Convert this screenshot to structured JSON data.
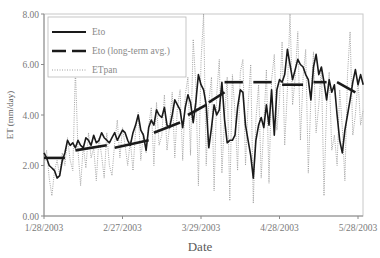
{
  "chart_data": {
    "type": "line",
    "title": "",
    "xlabel": "Date",
    "ylabel": "ET (mm/day)",
    "ylim": [
      0,
      8
    ],
    "yticks": [
      "0.00",
      "2.00",
      "4.00",
      "6.00",
      "8.00"
    ],
    "xticks": [
      "1/28/2003",
      "2/27/2003",
      "3/29/2003",
      "4/28/2003",
      "5/28/2003"
    ],
    "xtick_days": [
      0,
      30,
      60,
      90,
      120
    ],
    "grid": false,
    "legend_position": "upper left",
    "legend": [
      "Eto",
      "Eto (long-term avg.)",
      "ETpan"
    ],
    "x_unit": "days since 1/28/2003",
    "series": [
      {
        "name": "Eto",
        "style": "solid",
        "x": [
          0,
          1,
          2,
          3,
          4,
          5,
          6,
          7,
          8,
          9,
          10,
          11,
          12,
          13,
          14,
          15,
          16,
          17,
          18,
          19,
          20,
          21,
          22,
          23,
          24,
          25,
          26,
          27,
          28,
          29,
          30,
          31,
          32,
          33,
          34,
          35,
          36,
          37,
          38,
          39,
          40,
          41,
          42,
          43,
          44,
          45,
          46,
          47,
          48,
          49,
          50,
          51,
          52,
          53,
          54,
          55,
          56,
          57,
          58,
          59,
          60,
          61,
          62,
          63,
          64,
          65,
          66,
          67,
          68,
          69,
          70,
          71,
          72,
          73,
          74,
          75,
          76,
          77,
          78,
          79,
          80,
          81,
          82,
          83,
          84,
          85,
          86,
          87,
          88,
          89,
          90,
          91,
          92,
          93,
          94,
          95,
          96,
          97,
          98,
          99,
          100,
          101,
          102,
          103,
          104,
          105,
          106,
          107,
          108,
          109,
          110,
          111,
          112,
          113,
          114,
          115,
          116,
          117,
          118,
          119,
          120,
          121,
          122
        ],
        "values": [
          2.5,
          2.3,
          2.0,
          1.9,
          1.8,
          1.5,
          1.6,
          2.2,
          2.5,
          3.0,
          2.8,
          2.9,
          2.7,
          3.0,
          2.8,
          2.7,
          3.1,
          3.0,
          2.8,
          3.2,
          2.9,
          3.0,
          3.3,
          3.1,
          3.0,
          2.9,
          3.1,
          3.3,
          3.0,
          3.2,
          3.4,
          3.3,
          3.0,
          2.8,
          3.3,
          3.6,
          4.0,
          3.4,
          3.2,
          2.6,
          3.5,
          3.8,
          3.6,
          4.2,
          4.0,
          3.9,
          4.3,
          3.6,
          3.5,
          4.0,
          4.6,
          4.4,
          4.2,
          3.5,
          4.3,
          4.8,
          4.5,
          3.7,
          4.5,
          5.6,
          5.2,
          5.0,
          4.4,
          2.7,
          3.5,
          4.4,
          4.0,
          4.2,
          5.3,
          3.8,
          2.9,
          3.0,
          3.0,
          3.2,
          4.3,
          5.0,
          4.9,
          3.6,
          3.0,
          2.4,
          1.5,
          3.0,
          3.6,
          3.9,
          3.5,
          4.4,
          3.6,
          5.0,
          3.2,
          5.0,
          5.4,
          5.3,
          5.6,
          6.6,
          6.0,
          5.4,
          5.8,
          6.2,
          6.0,
          5.9,
          5.6,
          5.4,
          4.6,
          5.9,
          6.4,
          5.6,
          5.9,
          5.3,
          4.6,
          5.4,
          4.9,
          5.2,
          4.0,
          3.0,
          2.5,
          3.4,
          4.0,
          4.6,
          5.3,
          5.8,
          5.2,
          5.6,
          5.2
        ],
        "color": "#1a1a1a"
      },
      {
        "name": "Eto (long-term avg.)",
        "style": "dashed",
        "segments": [
          {
            "x0": 0,
            "x1": 8,
            "y0": 2.3,
            "y1": 2.3
          },
          {
            "x0": 12,
            "x1": 24,
            "y0": 2.6,
            "y1": 2.8
          },
          {
            "x0": 27,
            "x1": 40,
            "y0": 2.7,
            "y1": 3.0
          },
          {
            "x0": 42,
            "x1": 52,
            "y0": 3.3,
            "y1": 3.7
          },
          {
            "x0": 55,
            "x1": 62,
            "y0": 4.0,
            "y1": 4.4
          },
          {
            "x0": 63,
            "x1": 69,
            "y0": 4.5,
            "y1": 4.9
          },
          {
            "x0": 69,
            "x1": 76,
            "y0": 5.3,
            "y1": 5.3
          },
          {
            "x0": 80,
            "x1": 87,
            "y0": 5.3,
            "y1": 5.3
          },
          {
            "x0": 91,
            "x1": 99,
            "y0": 5.2,
            "y1": 5.2
          },
          {
            "x0": 103,
            "x1": 108,
            "y0": 5.3,
            "y1": 5.3
          },
          {
            "x0": 112,
            "x1": 119,
            "y0": 5.3,
            "y1": 4.9
          }
        ],
        "color": "#1a1a1a"
      },
      {
        "name": "ETpan",
        "style": "dotted",
        "x": [
          0,
          1,
          2,
          3,
          4,
          5,
          6,
          7,
          8,
          9,
          10,
          11,
          12,
          13,
          14,
          15,
          16,
          17,
          18,
          19,
          20,
          21,
          22,
          23,
          24,
          25,
          26,
          27,
          28,
          29,
          30,
          31,
          32,
          33,
          34,
          35,
          36,
          37,
          38,
          39,
          40,
          41,
          42,
          43,
          44,
          45,
          46,
          47,
          48,
          49,
          50,
          51,
          52,
          53,
          54,
          55,
          56,
          57,
          58,
          59,
          60,
          61,
          62,
          63,
          64,
          65,
          66,
          67,
          68,
          69,
          70,
          71,
          72,
          73,
          74,
          75,
          76,
          77,
          78,
          79,
          80,
          81,
          82,
          83,
          84,
          85,
          86,
          87,
          88,
          89,
          90,
          91,
          92,
          93,
          94,
          95,
          96,
          97,
          98,
          99,
          100,
          101,
          102,
          103,
          104,
          105,
          106,
          107,
          108,
          109,
          110,
          111,
          112,
          113,
          114,
          115,
          116,
          117,
          118,
          119,
          120,
          121,
          122
        ],
        "values": [
          2.0,
          2.6,
          1.5,
          0.8,
          1.8,
          2.2,
          1.6,
          2.5,
          2.0,
          3.1,
          2.2,
          1.8,
          5.8,
          2.6,
          1.2,
          2.8,
          1.9,
          3.3,
          2.3,
          2.7,
          1.4,
          3.1,
          2.4,
          1.5,
          3.3,
          2.0,
          1.6,
          2.9,
          3.8,
          2.3,
          3.5,
          2.8,
          2.0,
          3.0,
          1.8,
          3.4,
          4.1,
          2.2,
          3.3,
          2.5,
          3.6,
          4.3,
          2.0,
          4.5,
          2.8,
          3.2,
          4.8,
          2.6,
          3.6,
          4.9,
          2.3,
          4.3,
          5.0,
          2.2,
          4.8,
          5.5,
          2.4,
          7.0,
          5.2,
          1.2,
          6.1,
          8.0,
          2.0,
          4.5,
          5.5,
          1.0,
          4.8,
          6.2,
          1.7,
          3.9,
          5.5,
          0.6,
          5.6,
          4.1,
          1.8,
          5.7,
          6.2,
          2.0,
          4.4,
          6.0,
          0.5,
          3.8,
          5.2,
          1.5,
          3.6,
          5.8,
          1.3,
          5.4,
          6.4,
          3.4,
          4.6,
          6.9,
          2.8,
          5.0,
          8.0,
          4.4,
          5.5,
          7.3,
          3.0,
          5.5,
          6.6,
          1.7,
          4.7,
          6.5,
          3.3,
          4.4,
          5.9,
          0.8,
          4.4,
          5.7,
          2.6,
          3.2,
          2.0,
          5.0,
          3.5,
          1.4,
          5.6,
          7.3,
          3.2,
          4.0,
          5.4,
          3.6,
          4.2
        ],
        "color": "#9a9a9a"
      }
    ]
  },
  "axes": {
    "ylabel": "ET (mm/day)",
    "xlabel": "Date"
  },
  "legend": {
    "items": [
      {
        "label": "Eto"
      },
      {
        "label": "Eto (long-term avg.)"
      },
      {
        "label": "ETpan"
      }
    ]
  }
}
